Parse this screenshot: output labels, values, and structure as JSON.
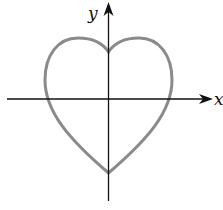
{
  "diagram": {
    "type": "heart-curve-plot",
    "axes": {
      "x_label": "x",
      "y_label": "y"
    },
    "curve": {
      "shape": "heart",
      "stroke_color": "#8a8a8a"
    },
    "axis_color": "#111111"
  }
}
